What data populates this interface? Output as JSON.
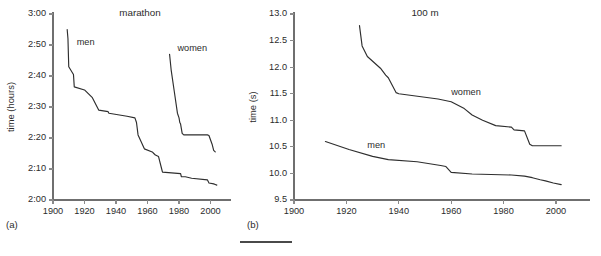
{
  "figure": {
    "width": 601,
    "height": 256,
    "background": "#ffffff",
    "line_color": "#2e2e2e",
    "axis_color": "#6f6f6f",
    "text_color": "#2b2b2b",
    "footer_rule": true
  },
  "panels": [
    {
      "caption": "(a)",
      "title": "marathon",
      "ylabel": "time (hours)",
      "xlabel": "",
      "series_labels": {
        "men": "men",
        "women": "women"
      }
    },
    {
      "caption": "(b)",
      "title": "100 m",
      "ylabel": "time (s)",
      "xlabel": "",
      "series_labels": {
        "men": "men",
        "women": "women"
      }
    }
  ],
  "chart_data": [
    {
      "type": "line",
      "panel": "(a)",
      "title": "marathon",
      "xlabel": "",
      "ylabel": "time (hours)",
      "xlim": [
        1900,
        2013
      ],
      "ylim": [
        120,
        180
      ],
      "xticks": [
        1900,
        1920,
        1940,
        1960,
        1980,
        2000
      ],
      "xticklabels": [
        "1900",
        "1920",
        "1940",
        "1960",
        "1980",
        "2000"
      ],
      "yticks": [
        120,
        130,
        140,
        150,
        160,
        170,
        180
      ],
      "yticklabels": [
        "2:00",
        "2:10",
        "2:20",
        "2:30",
        "2:40",
        "2:50",
        "3:00"
      ],
      "y_units": "minutes (displayed as h:mm)",
      "grid": false,
      "legend": "inline-annotations",
      "series": [
        {
          "name": "men",
          "label_x": 1915,
          "label_y": 170,
          "x": [
            1909,
            1909.5,
            1910,
            1913,
            1913.5,
            1920,
            1925,
            1929,
            1935,
            1935.5,
            1947,
            1952,
            1953,
            1954,
            1958,
            1963,
            1964,
            1965,
            1967,
            1969,
            1969.5,
            1981,
            1981.5,
            1984,
            1988,
            1998,
            1999,
            2002,
            2003,
            2004
          ],
          "y": [
            175.0,
            172.0,
            163.0,
            160.5,
            156.5,
            155.5,
            153.0,
            149.0,
            148.5,
            148.0,
            147.0,
            146.5,
            145.0,
            141.0,
            136.5,
            135.5,
            135.0,
            134.5,
            134.0,
            130.0,
            129.0,
            128.5,
            127.5,
            127.5,
            127.0,
            126.5,
            125.5,
            125.2,
            125.0,
            124.8
          ]
        },
        {
          "name": "women",
          "label_x": 1979,
          "label_y": 168,
          "x": [
            1974,
            1975,
            1977,
            1979,
            1980,
            1980.5,
            1981,
            1982,
            1983,
            1985,
            1998,
            1999,
            2001,
            2002,
            2003
          ],
          "y": [
            167.0,
            162.0,
            155.0,
            148.0,
            146.5,
            145.0,
            144.5,
            141.5,
            141.0,
            141.0,
            141.0,
            140.8,
            138.0,
            136.0,
            135.5
          ]
        }
      ]
    },
    {
      "type": "line",
      "panel": "(b)",
      "title": "100 m",
      "xlabel": "",
      "ylabel": "time (s)",
      "xlim": [
        1900,
        2013
      ],
      "ylim": [
        9.5,
        13.0
      ],
      "xticks": [
        1900,
        1920,
        1940,
        1960,
        1980,
        2000
      ],
      "xticklabels": [
        "1900",
        "1920",
        "1940",
        "1960",
        "1980",
        "2000"
      ],
      "yticks": [
        9.5,
        10.0,
        10.5,
        11.0,
        11.5,
        12.0,
        12.5,
        13.0
      ],
      "yticklabels": [
        "9.5",
        "10.0",
        "10.5",
        "11.0",
        "11.5",
        "12.0",
        "12.5",
        "13.0"
      ],
      "y_units": "seconds",
      "grid": false,
      "legend": "inline-annotations",
      "series": [
        {
          "name": "men",
          "label_x": 1928,
          "label_y": 10.48,
          "x": [
            1912,
            1921,
            1930,
            1936,
            1947,
            1956,
            1958,
            1960,
            1968,
            1983,
            1988,
            1991,
            1994,
            1996,
            1999,
            2002
          ],
          "y": [
            10.6,
            10.45,
            10.32,
            10.26,
            10.22,
            10.15,
            10.13,
            10.02,
            9.99,
            9.97,
            9.95,
            9.92,
            9.88,
            9.86,
            9.82,
            9.79
          ]
        },
        {
          "name": "women",
          "label_x": 1960,
          "label_y": 11.48,
          "x": [
            1925,
            1926,
            1928,
            1933,
            1935,
            1936,
            1939,
            1940,
            1955,
            1960,
            1965,
            1968,
            1972,
            1977,
            1983,
            1984,
            1988,
            1990,
            1991,
            2002
          ],
          "y": [
            12.78,
            12.4,
            12.2,
            11.98,
            11.85,
            11.8,
            11.52,
            11.5,
            11.4,
            11.35,
            11.22,
            11.1,
            11.0,
            10.9,
            10.87,
            10.82,
            10.8,
            10.55,
            10.52,
            10.52
          ]
        }
      ]
    }
  ],
  "footer": {
    "rule_x1": 240,
    "rule_x2": 292,
    "rule_y": 242
  }
}
